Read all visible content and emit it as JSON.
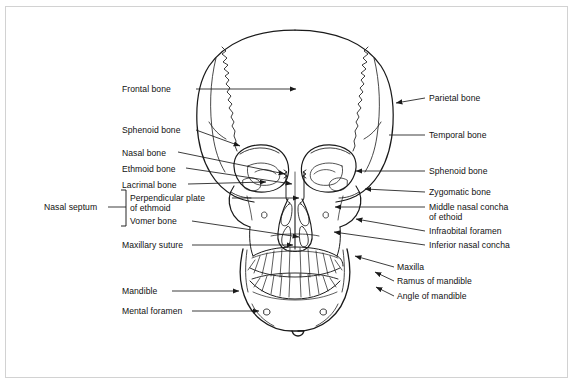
{
  "figure": {
    "border_color": "#d2d2d2",
    "line_color": "#1a1a1a",
    "background": "#ffffff"
  },
  "labels_left": [
    {
      "id": "frontal-bone",
      "text": "Frontal bone",
      "x": 122,
      "y": 84,
      "leader_from": [
        196,
        89
      ],
      "leader_to": [
        300,
        89
      ],
      "arrow": true
    },
    {
      "id": "sphenoid-bone-left",
      "text": "Sphenoid bone",
      "x": 122,
      "y": 125,
      "leader_from": [
        196,
        130
      ],
      "leader_to": [
        243,
        147
      ],
      "arrow": true
    },
    {
      "id": "nasal-bone",
      "text": "Nasal bone",
      "x": 122,
      "y": 148,
      "leader_from": [
        178,
        152
      ],
      "leader_to": [
        288,
        175
      ],
      "arrow": true
    },
    {
      "id": "ethmoid-bone",
      "text": "Ethmoid bone",
      "x": 122,
      "y": 164,
      "leader_from": [
        186,
        168
      ],
      "leader_to": [
        296,
        185
      ],
      "arrow": true
    },
    {
      "id": "lacrimal-bone",
      "text": "Lacrimal bone",
      "x": 122,
      "y": 180,
      "leader_from": [
        188,
        184
      ],
      "leader_to": [
        270,
        182
      ],
      "arrow": true
    },
    {
      "id": "perpendicular-plate",
      "text": "Perpendicular plate\nof ethmoid",
      "x": 128,
      "y": 193,
      "leader_from": [
        232,
        198
      ],
      "leader_to": [
        303,
        198
      ],
      "arrow": true
    },
    {
      "id": "vomer-bone",
      "text": "Vomer bone",
      "x": 128,
      "y": 217,
      "leader_from": [
        192,
        221
      ],
      "leader_to": [
        303,
        238
      ],
      "arrow": true
    },
    {
      "id": "nasal-septum",
      "text": "Nasal septum",
      "x": 44,
      "y": 203,
      "leader_from": [
        108,
        207
      ],
      "leader_to": [
        126,
        207
      ],
      "arrow": false
    },
    {
      "id": "maxillary-suture",
      "text": "Maxillary suture",
      "x": 122,
      "y": 241,
      "leader_from": [
        192,
        245
      ],
      "leader_to": [
        297,
        245
      ],
      "arrow": true
    },
    {
      "id": "mandible",
      "text": "Mandible",
      "x": 122,
      "y": 287,
      "leader_from": [
        172,
        291
      ],
      "leader_to": [
        243,
        291
      ],
      "arrow": true
    },
    {
      "id": "mental-foramen",
      "text": "Mental foramen",
      "x": 122,
      "y": 307,
      "leader_from": [
        192,
        311
      ],
      "leader_to": [
        263,
        311
      ],
      "arrow": true
    }
  ],
  "labels_right": [
    {
      "id": "parietal-bone",
      "text": "Parietal bone",
      "x": 429,
      "y": 94,
      "leader_from": [
        424,
        98
      ],
      "leader_to": [
        392,
        104
      ],
      "arrow": true
    },
    {
      "id": "temporal-bone",
      "text": "Temporal bone",
      "x": 429,
      "y": 131,
      "leader_from": [
        424,
        135
      ],
      "leader_to": [
        389,
        135
      ],
      "arrow": false
    },
    {
      "id": "sphenoid-bone-right",
      "text": "Sphenoid bone",
      "x": 429,
      "y": 167,
      "leader_from": [
        424,
        171
      ],
      "leader_to": [
        352,
        171
      ],
      "arrow": true
    },
    {
      "id": "zygomatic-bone",
      "text": "Zygomatic bone",
      "x": 429,
      "y": 188,
      "leader_from": [
        424,
        192
      ],
      "leader_to": [
        361,
        189
      ],
      "arrow": true
    },
    {
      "id": "middle-nasal-concha",
      "text": "Middle nasal concha\nof ethoid",
      "x": 429,
      "y": 203,
      "leader_from": [
        424,
        207
      ],
      "leader_to": [
        331,
        207
      ],
      "arrow": true
    },
    {
      "id": "infraobital-foramen",
      "text": "Infraobital foramen",
      "x": 429,
      "y": 227,
      "leader_from": [
        424,
        231
      ],
      "leader_to": [
        352,
        219
      ],
      "arrow": true
    },
    {
      "id": "inferior-nasal-concha",
      "text": "Inferior nasal concha",
      "x": 429,
      "y": 241,
      "leader_from": [
        424,
        245
      ],
      "leader_to": [
        330,
        232
      ],
      "arrow": true
    },
    {
      "id": "maxilla",
      "text": "Maxilla",
      "x": 396,
      "y": 263,
      "leader_from": [
        393,
        267
      ],
      "leader_to": [
        351,
        255
      ],
      "arrow": true
    },
    {
      "id": "ramus-of-mandible",
      "text": "Ramus of mandible",
      "x": 396,
      "y": 277,
      "leader_from": [
        393,
        281
      ],
      "leader_to": [
        371,
        271
      ],
      "arrow": true
    },
    {
      "id": "angle-of-mandible",
      "text": "Angle of mandible",
      "x": 396,
      "y": 292,
      "leader_from": [
        393,
        296
      ],
      "leader_to": [
        372,
        286
      ],
      "arrow": true
    }
  ],
  "bracket": {
    "id": "nasal-septum-bracket",
    "x": 126,
    "y_top": 190,
    "y_bottom": 226,
    "tick": 5
  }
}
